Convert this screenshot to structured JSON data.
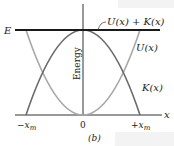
{
  "diagram": {
    "panel_label": "(b)",
    "y_axis_label": "Energy",
    "x_axis_label": "x",
    "energy_level_label": "E",
    "total_curve_label": "U(x) + K(x)",
    "potential_curve_label": "U(x)",
    "kinetic_curve_label": "K(x)",
    "ticks": {
      "left": "−x",
      "left_sub": "m",
      "center": "0",
      "right": "+x",
      "right_sub": "m"
    },
    "colors": {
      "axis": "#333333",
      "total": "#1a1a1a",
      "potential": "#a8a8a8",
      "kinetic": "#6a6a6a"
    }
  }
}
